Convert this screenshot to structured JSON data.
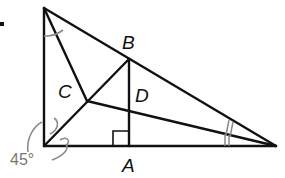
{
  "diagram": {
    "labels": {
      "B": "B",
      "C": "C",
      "D": "D",
      "A": "A",
      "angle": "45°"
    },
    "colors": {
      "line": "#111111",
      "annotation": "#8a8a8a"
    }
  }
}
